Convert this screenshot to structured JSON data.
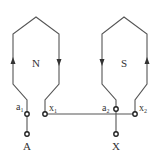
{
  "diagram": {
    "coils": [
      {
        "pole": "N",
        "arrow_left": "up",
        "arrow_right": "down"
      },
      {
        "pole": "S",
        "arrow_left": "down",
        "arrow_right": "up"
      }
    ],
    "terminals": {
      "a1": {
        "base": "a",
        "sub": "1"
      },
      "x1": {
        "base": "x",
        "sub": "1"
      },
      "a2": {
        "base": "a",
        "sub": "2"
      },
      "x2": {
        "base": "x",
        "sub": "2"
      }
    },
    "outputs": {
      "A": "A",
      "X": "X"
    },
    "colors": {
      "line": "#555555",
      "text": "#333333"
    }
  }
}
